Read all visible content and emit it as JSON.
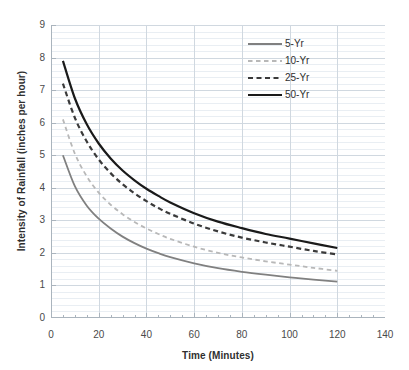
{
  "chart_data": {
    "type": "line",
    "title": "",
    "xlabel": "Time (Minutes)",
    "ylabel": "Intensity of Rainfall (inches per hour)",
    "xlim": [
      0,
      140
    ],
    "ylim": [
      0,
      9
    ],
    "xticks": [
      0,
      20,
      40,
      60,
      80,
      100,
      120,
      140
    ],
    "yticks": [
      0,
      1,
      2,
      3,
      4,
      5,
      6,
      7,
      8,
      9
    ],
    "xtick_labels": [
      "0",
      "20",
      "40",
      "60",
      "80",
      "100",
      "120",
      "140"
    ],
    "ytick_labels": [
      "0",
      "1",
      "2",
      "3",
      "4",
      "5",
      "6",
      "7",
      "8",
      "9"
    ],
    "x_minor_tick_interval": 5,
    "grid": "horizontal minor gridlines plus vertical major gridlines",
    "legend_position": "upper right",
    "x": [
      5,
      10,
      15,
      20,
      25,
      30,
      35,
      40,
      45,
      50,
      60,
      70,
      80,
      90,
      100,
      110,
      120
    ],
    "series": [
      {
        "name": "5-Yr",
        "color": "#808080",
        "style": "solid",
        "width": 1.8,
        "values": [
          5.0,
          4.05,
          3.45,
          3.05,
          2.75,
          2.5,
          2.3,
          2.13,
          1.99,
          1.87,
          1.68,
          1.53,
          1.42,
          1.33,
          1.25,
          1.18,
          1.12
        ]
      },
      {
        "name": "10-Yr",
        "color": "#b8b8b8",
        "style": "dashed",
        "width": 1.8,
        "values": [
          6.1,
          5.05,
          4.35,
          3.85,
          3.48,
          3.19,
          2.95,
          2.75,
          2.58,
          2.43,
          2.19,
          2.0,
          1.86,
          1.74,
          1.64,
          1.54,
          1.45
        ]
      },
      {
        "name": "25-Yr",
        "color": "#3a3a3a",
        "style": "dashed",
        "width": 2.2,
        "values": [
          7.2,
          6.15,
          5.42,
          4.87,
          4.45,
          4.11,
          3.83,
          3.59,
          3.38,
          3.2,
          2.9,
          2.66,
          2.47,
          2.32,
          2.19,
          2.06,
          1.95
        ]
      },
      {
        "name": "50-Yr",
        "color": "#1a1a1a",
        "style": "solid",
        "width": 2.2,
        "values": [
          7.9,
          6.75,
          5.95,
          5.36,
          4.9,
          4.53,
          4.23,
          3.97,
          3.75,
          3.55,
          3.22,
          2.96,
          2.76,
          2.58,
          2.44,
          2.29,
          2.15
        ]
      }
    ]
  },
  "legend": {
    "items": [
      {
        "label": "5-Yr"
      },
      {
        "label": "10-Yr"
      },
      {
        "label": "25-Yr"
      },
      {
        "label": "50-Yr"
      }
    ]
  },
  "colors": {
    "series_5yr": "#808080",
    "series_10yr": "#b8b8b8",
    "series_25yr": "#3a3a3a",
    "series_50yr": "#1a1a1a",
    "grid_minor": "#e9eef3",
    "grid_major": "#d0d8e0",
    "axis": "#aab4bd",
    "text": "#3a3a3a"
  }
}
